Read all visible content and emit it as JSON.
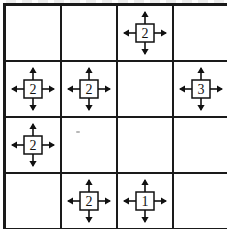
{
  "puzzle": {
    "type": "arrow-clue-grid",
    "rows": 4,
    "columns": 4,
    "line_color": "#1a1a1a",
    "background_color": "#ffffff",
    "digit_color": "#111111",
    "arrow_directions": [
      "up",
      "right",
      "down",
      "left"
    ],
    "cells": [
      [
        {
          "value": "",
          "has_clue": false
        },
        {
          "value": "",
          "has_clue": false
        },
        {
          "value": "2",
          "has_clue": true
        },
        {
          "value": "",
          "has_clue": false
        }
      ],
      [
        {
          "value": "2",
          "has_clue": true
        },
        {
          "value": "2",
          "has_clue": true
        },
        {
          "value": "",
          "has_clue": false
        },
        {
          "value": "3",
          "has_clue": true
        }
      ],
      [
        {
          "value": "2",
          "has_clue": true
        },
        {
          "value": "",
          "has_clue": false
        },
        {
          "value": "",
          "has_clue": false
        },
        {
          "value": "",
          "has_clue": false
        }
      ],
      [
        {
          "value": "",
          "has_clue": false
        },
        {
          "value": "2",
          "has_clue": true
        },
        {
          "value": "1",
          "has_clue": true
        },
        {
          "value": "",
          "has_clue": false
        }
      ]
    ]
  }
}
